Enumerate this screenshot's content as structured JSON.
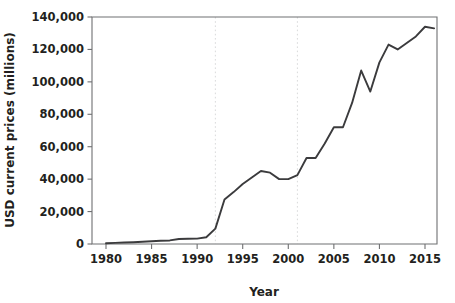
{
  "chart_data": {
    "type": "line",
    "title": "",
    "xlabel": "Year",
    "ylabel": "USD current prices (millions)",
    "xlim": [
      1979,
      1979
    ],
    "ylim": [
      0,
      140000
    ],
    "grid": "vertical-dotted-at-1992-and-2001",
    "legend": "none",
    "x_ticks": [
      "1980",
      "1985",
      "1990",
      "1995",
      "2000",
      "2005",
      "2010",
      "2015"
    ],
    "y_ticks": [
      "0",
      "20,000",
      "40,000",
      "60,000",
      "80,000",
      "100,000",
      "120,000",
      "140,000"
    ],
    "y_tick_values": [
      0,
      20000,
      40000,
      60000,
      80000,
      100000,
      120000,
      140000
    ],
    "x_tick_values": [
      1980,
      1985,
      1990,
      1995,
      2000,
      2005,
      2010,
      2015
    ],
    "x_axis_range": [
      1979,
      1980
    ],
    "vertical_gridline_years": [
      1992,
      2001
    ],
    "series": [
      {
        "name": "USD current prices (millions)",
        "color": "#3b3b3d",
        "x": [
          1980,
          1981,
          1982,
          1983,
          1984,
          1985,
          1986,
          1987,
          1988,
          1989,
          1990,
          1991,
          1992,
          1993,
          1994,
          1995,
          1996,
          1997,
          1998,
          1999,
          2000,
          2001,
          2002,
          2003,
          2004,
          2005,
          2006,
          2007,
          2008,
          2009,
          2010,
          2011,
          2012,
          2013,
          2014,
          2015,
          2016
        ],
        "values": [
          500,
          700,
          900,
          1100,
          1400,
          1700,
          2000,
          2200,
          3100,
          3200,
          3300,
          4200,
          9500,
          27500,
          32000,
          37000,
          41000,
          45000,
          44000,
          40000,
          40000,
          42500,
          53000,
          53000,
          62000,
          72000,
          72000,
          87000,
          107000,
          94000,
          112000,
          123000,
          120000,
          124000,
          128000,
          134000,
          133000
        ]
      }
    ]
  },
  "axes": {
    "x_title": "Year",
    "y_title": "USD current prices (millions)"
  }
}
